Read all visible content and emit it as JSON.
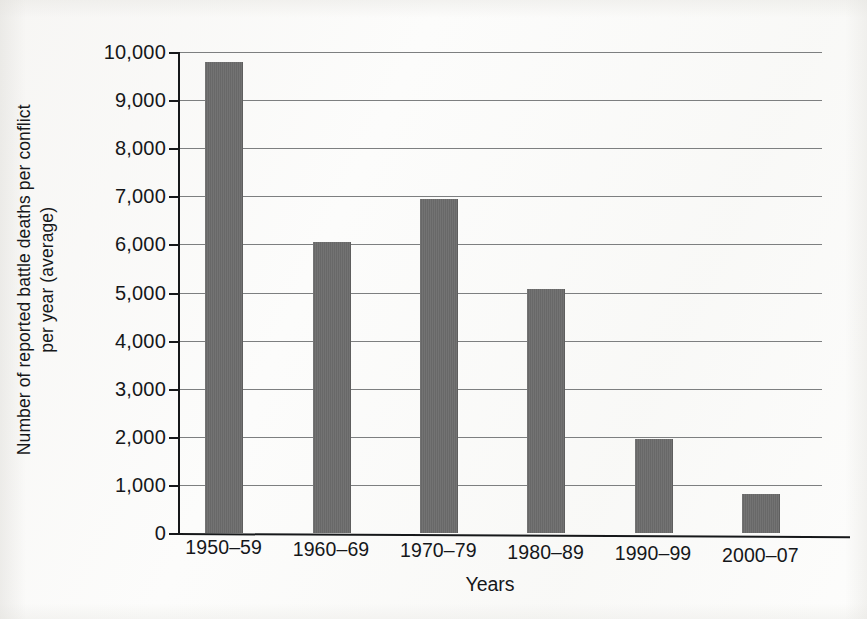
{
  "chart_data": {
    "type": "bar",
    "title": "",
    "xlabel": "Years",
    "ylabel_lines": [
      "Number of reported battle deaths per conflict",
      "per year (average)"
    ],
    "ylabel": "Number of reported battle deaths per conflict per year (average)",
    "categories": [
      "1950–59",
      "1960–69",
      "1970–79",
      "1980–89",
      "1990–99",
      "2000–07"
    ],
    "values": [
      9800,
      6050,
      6950,
      5080,
      1950,
      820
    ],
    "ylim": [
      0,
      10000
    ],
    "ytick_labels": [
      "0",
      "1,000",
      "2,000",
      "3,000",
      "4,000",
      "5,000",
      "6,000",
      "7,000",
      "8,000",
      "9,000",
      "10,000"
    ],
    "ytick_values": [
      0,
      1000,
      2000,
      3000,
      4000,
      5000,
      6000,
      7000,
      8000,
      9000,
      10000
    ],
    "grid": "horizontal",
    "legend": "none",
    "bar_color": "#6b6b6b",
    "axis_color": "#16181a",
    "grid_color": "#7d7f80",
    "background_color": "#fcfcfb"
  }
}
